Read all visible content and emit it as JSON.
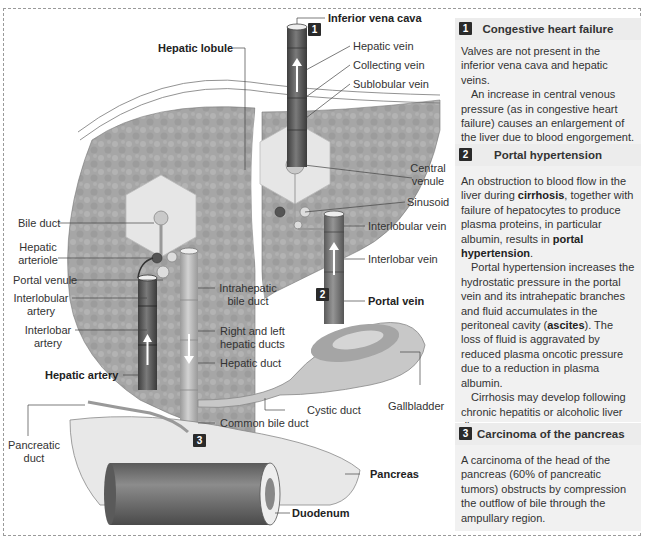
{
  "diagram": {
    "labels": {
      "inferior_vena_cava": "Inferior vena cava",
      "hepatic_vein": "Hepatic vein",
      "collecting_vein": "Collecting vein",
      "sublobular_vein": "Sublobular vein",
      "hepatic_lobule": "Hepatic lobule",
      "central_venule_1": "Central",
      "central_venule_2": "venule",
      "sinusoid": "Sinusoid",
      "interlobular_vein": "Interlobular vein",
      "interlobar_vein": "Interlobar vein",
      "portal_vein": "Portal vein",
      "bile_duct": "Bile duct",
      "hepatic_arteriole_1": "Hepatic",
      "hepatic_arteriole_2": "arteriole",
      "portal_venule": "Portal venule",
      "interlobular_artery_1": "Interlobular",
      "interlobular_artery_2": "artery",
      "interlobar_artery_1": "Interlobar",
      "interlobar_artery_2": "artery",
      "hepatic_artery": "Hepatic artery",
      "intrahepatic_bile_duct_1": "Intrahepatic",
      "intrahepatic_bile_duct_2": "bile duct",
      "right_left_hepatic_ducts_1": "Right and left",
      "right_left_hepatic_ducts_2": "hepatic ducts",
      "hepatic_duct": "Hepatic duct",
      "cystic_duct": "Cystic duct",
      "gallbladder": "Gallbladder",
      "common_bile_duct": "Common bile duct",
      "pancreatic_duct_1": "Pancreatic",
      "pancreatic_duct_2": "duct",
      "pancreas": "Pancreas",
      "duodenum": "Duodenum"
    },
    "badges": {
      "one": "1",
      "two": "2",
      "three": "3"
    }
  },
  "panels": [
    {
      "number": "1",
      "title": "Congestive heart failure",
      "paragraphs": [
        "Valves are not present in the inferior vena cava and hepatic veins.",
        "An increase in central venous pressure (as in congestive heart failure) causes an enlargement of the liver due to blood engorgement."
      ]
    },
    {
      "number": "2",
      "title": "Portal hypertension",
      "p1_a": "An obstruction to blood flow in the liver during ",
      "p1_bold1": "cirrhosis",
      "p1_b": ", together with failure of hepatocytes to produce plasma proteins, in particular albumin, results in ",
      "p1_bold2": "portal hypertension",
      "p1_c": ".",
      "p2_a": "Portal hypertension increases the hydrostatic pressure in the portal vein and its intrahepatic branches and fluid accumulates in the peritoneal cavity (",
      "p2_bold": "ascites",
      "p2_b": "). The loss of fluid is aggravated by reduced plasma oncotic pressure due to a reduction in plasma albumin.",
      "p3": "Cirrhosis may develop following chronic hepatitis or alcoholic liver disease."
    },
    {
      "number": "3",
      "title": "Carcinoma of the pancreas",
      "paragraphs": [
        "A carcinoma of the head of the pancreas (60% of pancreatic tumors) obstructs by compression the outflow of bile through the ampullary region."
      ]
    }
  ],
  "colors": {
    "liver": "#a9a9a9",
    "lobule": "#e6e6e6",
    "vessel_dark": "#5c5c5c",
    "vessel_mid": "#7a7a7a",
    "duct": "#bdbdbd",
    "panel_bg": "#f1f1f1",
    "panel_head": "#ececec",
    "badge": "#2a2a2a"
  }
}
